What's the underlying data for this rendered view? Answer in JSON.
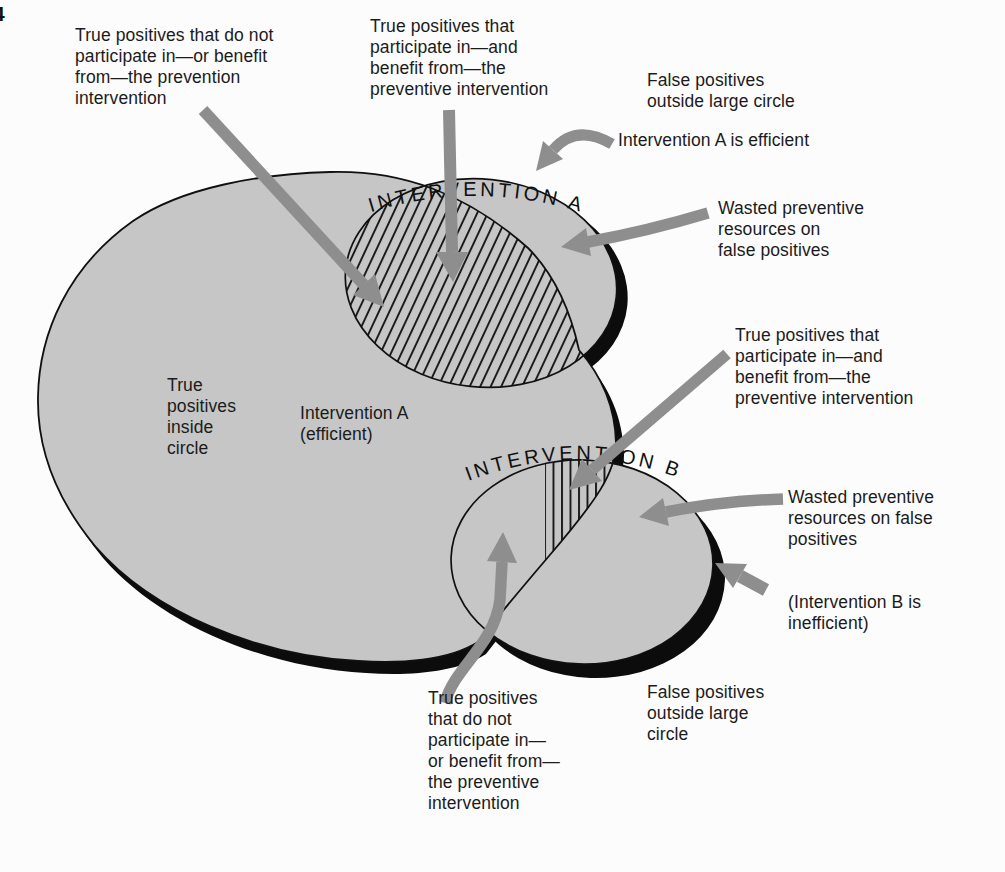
{
  "page_number": "4",
  "diagram": {
    "titles": {
      "intervention_a": "INTERVENTION A",
      "intervention_b": "INTERVENTION B"
    },
    "region_labels": {
      "inside_circle": "True\npositives\ninside\ncircle",
      "intervention_a_inside": "Intervention A\n(efficient)"
    },
    "annotations": {
      "top_left": "True positives that do not\nparticipate in—or benefit\nfrom—the prevention\nintervention",
      "top_center": "True positives that\nparticipate in—and\nbenefit from—the\npreventive intervention",
      "false_positives_a": "False positives\noutside large circle",
      "efficient_a": "Intervention A is efficient",
      "wasted_a": "Wasted preventive\nresources on\nfalse positives",
      "true_positives_b": "True positives that\nparticipate in—and\nbenefit from—the\npreventive intervention",
      "wasted_b": "Wasted preventive\nresources on false\npositives",
      "inefficient_b": "(Intervention B is\ninefficient)",
      "false_positives_b": "False positives\noutside large\ncircle",
      "bottom": "True positives\nthat do not\nparticipate in—\nor benefit from—\nthe preventive\nintervention"
    },
    "colors": {
      "region_fill_gray": "#c6c6c6",
      "arrow_gray": "#8e8e8e",
      "shadow_black": "#0c0c0c",
      "outline_black": "#101010",
      "text_black": "#1b1b1b"
    }
  }
}
